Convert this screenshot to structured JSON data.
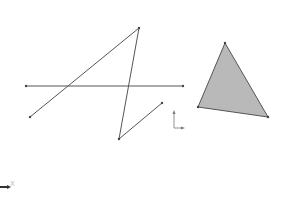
{
  "canvas": {
    "background": "#ffffff",
    "stroke_color": "#555555",
    "fill_color": "#b9b9b9",
    "horizontal_line": {
      "x1": 26,
      "y1": 86,
      "x2": 183,
      "y2": 86
    },
    "polyline": [
      [
        30,
        117
      ],
      [
        139,
        28
      ],
      [
        119,
        139
      ],
      [
        162,
        103
      ]
    ],
    "triangle": [
      [
        225,
        43
      ],
      [
        198,
        107
      ],
      [
        268,
        117
      ]
    ],
    "local_axes": {
      "origin": [
        174,
        128
      ],
      "x_end": [
        184,
        128
      ],
      "y_end": [
        174,
        111
      ]
    },
    "ucs_icon": {
      "label": "X"
    }
  }
}
